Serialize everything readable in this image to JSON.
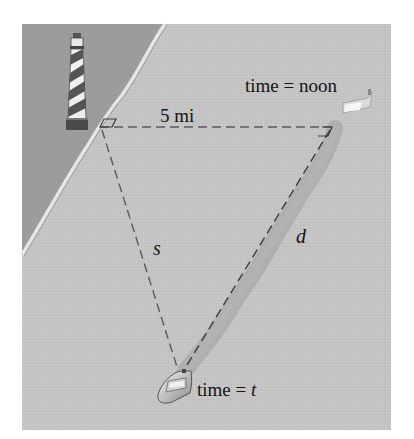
{
  "figure": {
    "colors": {
      "background": "#ffffff",
      "land": "#9c9c9c",
      "sea": "#c4c4c4",
      "shoreline": "#e2e2e2",
      "wake": "#a6a6a6",
      "dashed_line": "#5a5a5a",
      "text": "#141414"
    }
  },
  "labels": {
    "distance": "5 mi",
    "time_noon": "time = noon",
    "time_t_prefix": "time = ",
    "time_t_var": "t",
    "s": "s",
    "d": "d"
  },
  "icons": {
    "lighthouse": "lighthouse-icon",
    "boat_noon": "boat-icon",
    "boat_t": "boat-icon"
  }
}
